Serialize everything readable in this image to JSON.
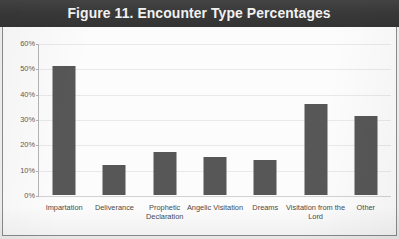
{
  "figure": {
    "title": "Figure 11. Encounter Type Percentages"
  },
  "colors": {
    "title_bar_background": "#3b3b3b",
    "title_text": "#f4f4f4",
    "bar_fill": "#575757",
    "gridline": "#e9e9e9",
    "axis_line": "#b4b4b4",
    "plot_background": "#fcfcfc",
    "frame_border": "#8d8d8d",
    "tick_label": "#5a5a5a"
  },
  "chart_data": {
    "type": "bar",
    "title": "Figure 11. Encounter Type Percentages",
    "xlabel": "",
    "ylabel": "",
    "categories": [
      "Impartation",
      "Deliverance",
      "Prophetic Declaration",
      "Angelic Visitation",
      "Dreams",
      "Visitation from the Lord",
      "Other"
    ],
    "values": [
      51,
      12,
      17,
      15,
      14,
      36,
      31
    ],
    "value_labels": [
      "51%",
      "12%",
      "17%",
      "15%",
      "14%",
      "36%",
      "31%"
    ],
    "ylim": [
      0,
      60
    ],
    "ytick_labels": [
      "0%",
      "10%",
      "20%",
      "30%",
      "40%",
      "50%",
      "60%"
    ],
    "ytick_values": [
      0,
      10,
      20,
      30,
      40,
      50,
      60
    ],
    "grid": true,
    "grid_axis": "y",
    "legend": false,
    "legend_position": "none",
    "orientation": "vertical",
    "units": "percent"
  }
}
